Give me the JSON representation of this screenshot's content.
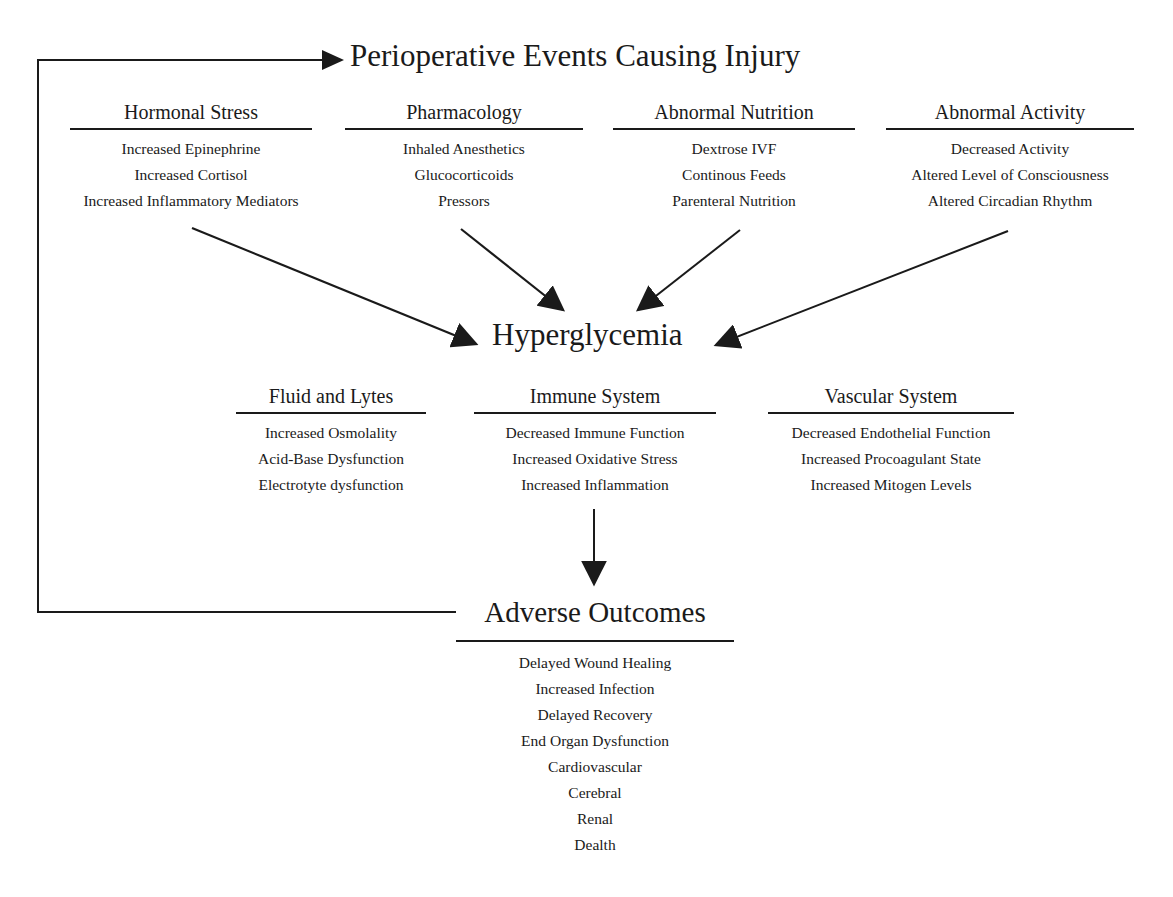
{
  "diagram": {
    "top_title": "Perioperative Events Causing Injury",
    "center_title": "Hyperglycemia",
    "causes": [
      {
        "heading": "Hormonal Stress",
        "items": [
          "Increased Epinephrine",
          "Increased Cortisol",
          "Increased Inflammatory Mediators"
        ]
      },
      {
        "heading": "Pharmacology",
        "items": [
          "Inhaled Anesthetics",
          "Glucocorticoids",
          "Pressors"
        ]
      },
      {
        "heading": "Abnormal Nutrition",
        "items": [
          "Dextrose IVF",
          "Continous Feeds",
          "Parenteral Nutrition"
        ]
      },
      {
        "heading": "Abnormal Activity",
        "items": [
          "Decreased Activity",
          "Altered Level of Consciousness",
          "Altered Circadian Rhythm"
        ]
      }
    ],
    "effects": [
      {
        "heading": "Fluid and Lytes",
        "items": [
          "Increased Osmolality",
          "Acid-Base Dysfunction",
          "Electrotyte dysfunction"
        ]
      },
      {
        "heading": "Immune System",
        "items": [
          "Decreased Immune Function",
          "Increased Oxidative Stress",
          "Increased Inflammation"
        ]
      },
      {
        "heading": "Vascular System",
        "items": [
          "Decreased Endothelial Function",
          "Increased Procoagulant State",
          "Increased Mitogen Levels"
        ]
      }
    ],
    "outcomes": {
      "heading": "Adverse Outcomes",
      "items": [
        "Delayed Wound Healing",
        "Increased Infection",
        "Delayed Recovery",
        "End Organ Dysfunction",
        "Cardiovascular",
        "Cerebral",
        "Renal",
        "Dealth"
      ]
    },
    "colors": {
      "ink": "#1a1a1a",
      "background": "#ffffff"
    }
  }
}
